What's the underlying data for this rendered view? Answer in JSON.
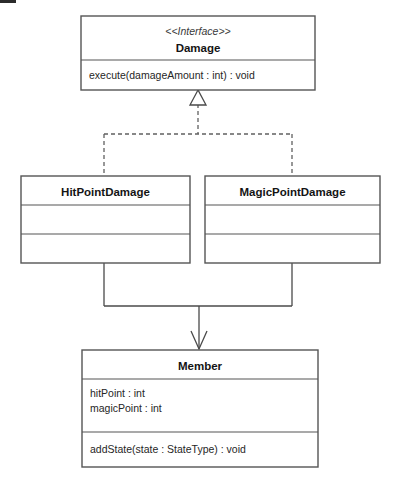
{
  "diagram": {
    "kind": "uml-class-diagram",
    "canvas": {
      "width": 397,
      "height": 490
    },
    "colors": {
      "background": "#ffffff",
      "box_fill": "#ffffff",
      "box_stroke": "#555555",
      "edge_stroke": "#4a4a4a",
      "dashed_edge_stroke": "#606060",
      "text": "#141414"
    },
    "classes": [
      {
        "id": "damage",
        "stereotype": "<<Interface>>",
        "name": "Damage",
        "x": 81,
        "y": 16,
        "width": 234,
        "height": 74,
        "header_height": 44,
        "attributes": [],
        "operations": [
          "execute(damageAmount : int) : void"
        ],
        "compartments": [
          "header",
          "operations"
        ]
      },
      {
        "id": "hitPointDamage",
        "stereotype": "",
        "name": "HitPointDamage",
        "x": 21,
        "y": 176,
        "width": 169,
        "height": 87,
        "header_height": 29,
        "attributes": [],
        "operations": [],
        "compartments": [
          "header",
          "attributes",
          "operations"
        ]
      },
      {
        "id": "magicPointDamage",
        "stereotype": "",
        "name": "MagicPointDamage",
        "x": 205,
        "y": 176,
        "width": 175,
        "height": 87,
        "header_height": 29,
        "attributes": [],
        "operations": [],
        "compartments": [
          "header",
          "attributes",
          "operations"
        ]
      },
      {
        "id": "member",
        "stereotype": "",
        "name": "Member",
        "x": 82,
        "y": 350,
        "width": 236,
        "height": 117,
        "header_height": 29,
        "attributes": [
          "hitPoint : int",
          "magicPoint : int"
        ],
        "operations": [
          "addState(state : StateType) : void"
        ],
        "compartments": [
          "header",
          "attributes",
          "operations"
        ]
      }
    ],
    "edges": [
      {
        "id": "realization-hitpoint",
        "type": "realization",
        "style": "dashed",
        "arrowhead": "hollow-triangle",
        "from": "HitPointDamage",
        "to": "Damage",
        "label": ""
      },
      {
        "id": "realization-magicpoint",
        "type": "realization",
        "style": "dashed",
        "arrowhead": "hollow-triangle",
        "from": "MagicPointDamage",
        "to": "Damage",
        "label": ""
      },
      {
        "id": "dependency-hitpoint-member",
        "type": "dependency",
        "style": "solid",
        "arrowhead": "open-arrow",
        "from": "HitPointDamage",
        "to": "Member",
        "label": ""
      },
      {
        "id": "dependency-magicpoint-member",
        "type": "dependency",
        "style": "solid",
        "arrowhead": "open-arrow",
        "from": "MagicPointDamage",
        "to": "Member",
        "label": ""
      }
    ]
  }
}
